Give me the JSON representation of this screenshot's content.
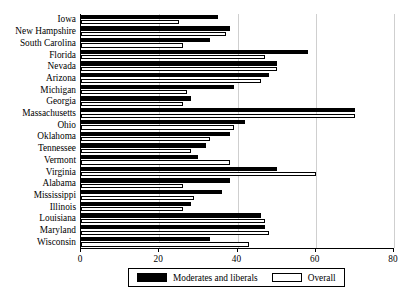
{
  "chart_data": {
    "type": "bar",
    "orientation": "horizontal",
    "title": "",
    "subtitle": "",
    "xlabel": "",
    "ylabel": "",
    "xlim": [
      0,
      80
    ],
    "xticks": [
      0,
      20,
      40,
      60,
      80
    ],
    "xtick_labels": [
      "0",
      "20",
      "40",
      "60",
      "80"
    ],
    "grid": true,
    "grid_axis": "x",
    "legend_position": "bottom",
    "categories": [
      "Iowa",
      "New Hampshire",
      "South Carolina",
      "Florida",
      "Nevada",
      "Arizona",
      "Michigan",
      "Georgia",
      "Massachusetts",
      "Ohio",
      "Oklahoma",
      "Tennessee",
      "Vermont",
      "Virginia",
      "Alabama",
      "Mississippi",
      "Illinois",
      "Louisiana",
      "Maryland",
      "Wisconsin"
    ],
    "series": [
      {
        "name": "Moderates and liberals",
        "color": "#000000",
        "values": [
          35,
          38,
          33,
          58,
          50,
          48,
          39,
          28,
          70,
          42,
          38,
          32,
          30,
          50,
          38,
          36,
          28,
          46,
          47,
          33
        ]
      },
      {
        "name": "Overall",
        "color": "#ffffff",
        "values": [
          25,
          37,
          26,
          47,
          50,
          46,
          27,
          26,
          70,
          39,
          33,
          28,
          38,
          60,
          26,
          29,
          26,
          47,
          48,
          43
        ]
      }
    ]
  },
  "legend": {
    "items": [
      {
        "label": "Moderates and liberals",
        "swatch": "dark"
      },
      {
        "label": "Overall",
        "swatch": "light"
      }
    ]
  }
}
